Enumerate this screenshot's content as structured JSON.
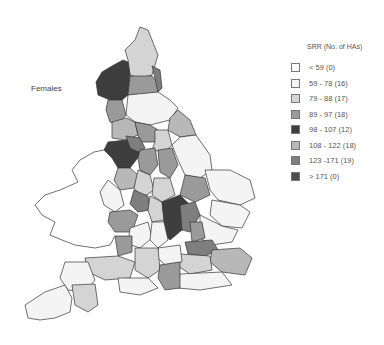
{
  "map": {
    "title": "Females",
    "legend": {
      "title": "SRR (No. of HAs)",
      "items": [
        {
          "label": "< 59 (0)",
          "color": "#ffffff"
        },
        {
          "label": "59 - 78 (16)",
          "color": "#f4f4f4"
        },
        {
          "label": "79 - 88 (17)",
          "color": "#d4d4d4"
        },
        {
          "label": "89 - 97 (18)",
          "color": "#9a9a9a"
        },
        {
          "label": "98 - 107 (12)",
          "color": "#3e3e3e"
        },
        {
          "label": "108 - 122 (18)",
          "color": "#b8b8b8"
        },
        {
          "label": "123 -171 (19)",
          "color": "#7e7e7e"
        },
        {
          "label": "> 171 (0)",
          "color": "#4e4e4e"
        }
      ]
    }
  }
}
